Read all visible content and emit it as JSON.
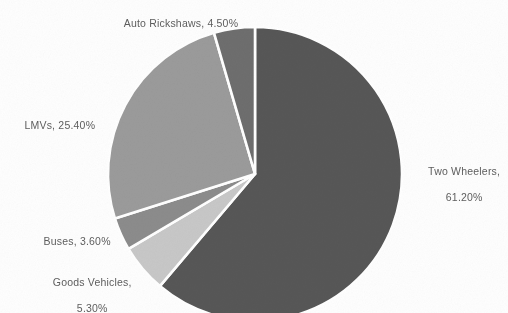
{
  "chart_data": {
    "type": "pie",
    "title": "",
    "subtitle": "",
    "xlabel": "",
    "ylabel": "",
    "legend_position": "none",
    "grid": false,
    "units": "percent",
    "categories": [
      "Two Wheelers",
      "Goods Vehicles",
      "Buses",
      "LMVs",
      "Auto Rickshaws"
    ],
    "values": [
      61.2,
      5.3,
      3.6,
      25.4,
      4.5
    ],
    "slices": [
      {
        "name": "Two Wheelers",
        "value": 61.2,
        "value_text": "61.20%",
        "label_line1": "Two Wheelers,",
        "label_line2": "61.20%",
        "color": "#575757",
        "start_angle_deg": 0,
        "end_angle_deg": 220.32
      },
      {
        "name": "Goods Vehicles",
        "value": 5.3,
        "value_text": "5.30%",
        "label_line1": "Goods Vehicles,",
        "label_line2": "5.30%",
        "color": "#c8c8c8",
        "start_angle_deg": 220.32,
        "end_angle_deg": 239.4
      },
      {
        "name": "Buses",
        "value": 3.6,
        "value_text": "3.60%",
        "label_line1": "Buses, 3.60%",
        "label_line2": "",
        "color": "#8c8c8c",
        "start_angle_deg": 239.4,
        "end_angle_deg": 252.36
      },
      {
        "name": "LMVs",
        "value": 25.4,
        "value_text": "25.40%",
        "label_line1": "LMVs, 25.40%",
        "label_line2": "",
        "color": "#9b9b9b",
        "start_angle_deg": 252.36,
        "end_angle_deg": 343.8
      },
      {
        "name": "Auto Rickshaws",
        "value": 4.5,
        "value_text": "4.50%",
        "label_line1": "Auto Rickshaws, 4.50%",
        "label_line2": "",
        "color": "#6e6e6e",
        "start_angle_deg": 343.8,
        "end_angle_deg": 360
      }
    ],
    "separator_color": "#ffffff",
    "background_color": "#ffffff",
    "label_color": "#5d5d5d"
  },
  "labels": {
    "two_wheelers_line1": "Two Wheelers,",
    "two_wheelers_line2": "61.20%",
    "goods_vehicles_line1": "Goods Vehicles,",
    "goods_vehicles_line2": "5.30%",
    "buses": "Buses, 3.60%",
    "lmvs": "LMVs, 25.40%",
    "auto_rickshaws": "Auto Rickshaws, 4.50%"
  }
}
